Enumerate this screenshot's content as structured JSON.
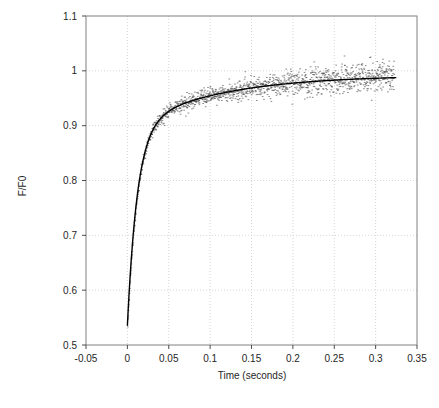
{
  "chart_data": {
    "type": "scatter",
    "title": "",
    "xlabel": "Time (seconds)",
    "ylabel": "F/F0",
    "xlim": [
      -0.05,
      0.35
    ],
    "ylim": [
      0.5,
      1.1
    ],
    "grid": true,
    "legend": null,
    "xticks": [
      "-0.05",
      "0",
      "0.05",
      "0.1",
      "0.15",
      "0.2",
      "0.25",
      "0.3",
      "0.35"
    ],
    "xtick_values": [
      -0.05,
      0,
      0.05,
      0.1,
      0.15,
      0.2,
      0.25,
      0.3,
      0.35
    ],
    "yticks": [
      "0.5",
      "0.6",
      "0.7",
      "0.8",
      "0.9",
      "1",
      "1.1"
    ],
    "ytick_values": [
      0.5,
      0.6,
      0.7,
      0.8,
      0.9,
      1.0,
      1.1
    ],
    "series": [
      {
        "name": "fit curve",
        "type": "line",
        "color": "#000000",
        "model": "F/F0 = A - B*exp(-t/tau1) - C*exp(-t/tau2)",
        "params": {
          "A": 0.992,
          "B": 0.36,
          "tau1": 0.012,
          "C": 0.097,
          "tau2": 0.105
        },
        "x_start": 0.0,
        "x_end": 0.325,
        "y_start": 0.535,
        "y_end": 0.986
      },
      {
        "name": "measured data",
        "type": "scatter",
        "color": "#4d4d4d",
        "marker": "dot",
        "n_points": 1400,
        "x_start": 0.0,
        "x_end": 0.322,
        "noise_sd_start": 0.004,
        "noise_sd_end": 0.016
      }
    ]
  }
}
